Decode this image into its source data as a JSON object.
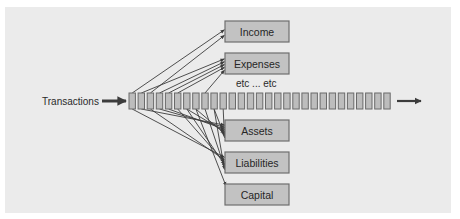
{
  "diagram": {
    "source_label": "Transactions",
    "separator_label": "etc ... etc",
    "tape_cell_count": 29,
    "accounts": [
      {
        "id": "income",
        "label": "Income"
      },
      {
        "id": "expenses",
        "label": "Expenses"
      },
      {
        "id": "assets",
        "label": "Assets"
      },
      {
        "id": "liabilities",
        "label": "Liabilities"
      },
      {
        "id": "capital",
        "label": "Capital"
      }
    ],
    "postings": [
      {
        "cell": 0,
        "account": "income"
      },
      {
        "cell": 2,
        "account": "income"
      },
      {
        "cell": 1,
        "account": "expenses"
      },
      {
        "cell": 3,
        "account": "expenses"
      },
      {
        "cell": 4,
        "account": "expenses"
      },
      {
        "cell": 5,
        "account": "expenses"
      },
      {
        "cell": 8,
        "account": "expenses"
      },
      {
        "cell": 0,
        "account": "liabilities"
      },
      {
        "cell": 1,
        "account": "assets"
      },
      {
        "cell": 2,
        "account": "liabilities"
      },
      {
        "cell": 3,
        "account": "assets"
      },
      {
        "cell": 4,
        "account": "assets"
      },
      {
        "cell": 5,
        "account": "liabilities"
      },
      {
        "cell": 6,
        "account": "assets"
      },
      {
        "cell": 6,
        "account": "liabilities"
      },
      {
        "cell": 7,
        "account": "assets"
      },
      {
        "cell": 7,
        "account": "capital"
      },
      {
        "cell": 8,
        "account": "liabilities"
      },
      {
        "cell": 9,
        "account": "assets"
      },
      {
        "cell": 9,
        "account": "liabilities"
      },
      {
        "cell": 10,
        "account": "assets"
      }
    ],
    "colors": {
      "panel": "#ebebeb",
      "box_fill": "#c2c2c2",
      "box_stroke": "#6e6e6e",
      "cell_fill": "#bdbdbd",
      "cell_stroke": "#6a6a6a",
      "arrow": "#3c3c3c",
      "text": "#262626"
    }
  }
}
